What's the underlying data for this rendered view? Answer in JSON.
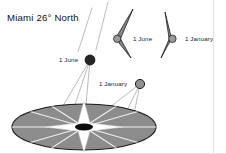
{
  "figure": {
    "title": "Miami 26° North",
    "location": "Miami",
    "latitude_label": "26° North",
    "type": "solar-path-diagram"
  },
  "colors": {
    "background": "#ffffff",
    "disk_fill": "#8c8c8c",
    "disk_stroke": "#1a1a1a",
    "cone_fill": "#878787",
    "cone_stroke": "#1f1f1f",
    "sun_june": "#262626",
    "sun_january": "#8f8f8f",
    "ray": "#b9b9b9",
    "compass_star": "#ffffff",
    "compass_center": "#0d0d0d",
    "text": "#1d1d1d",
    "edge_line": "#e2e2e2"
  },
  "cones": [
    {
      "id": "cone-june",
      "label": "1 June",
      "label_x": 133,
      "label_y": 36,
      "shape": "shadow-cone-narrow"
    },
    {
      "id": "cone-january",
      "label": "1 January",
      "label_x": 185,
      "label_y": 36,
      "shape": "shadow-cone-wide"
    }
  ],
  "suns": [
    {
      "id": "sun-june",
      "label": "1 June",
      "label_x": 59,
      "label_y": 57,
      "cx": 90,
      "cy": 60,
      "r": 5.4,
      "fill": "#262626"
    },
    {
      "id": "sun-january",
      "label": "1 January",
      "label_x": 99,
      "label_y": 81,
      "cx": 140,
      "cy": 84,
      "r": 4.6,
      "fill": "#8f8f8f"
    }
  ],
  "horizon_disk": {
    "name": "horizon-plane",
    "center_x": 84,
    "center_y": 127,
    "radius_x": 72,
    "radius_y": 23,
    "compass_points": 4,
    "radial_lines": 8
  }
}
